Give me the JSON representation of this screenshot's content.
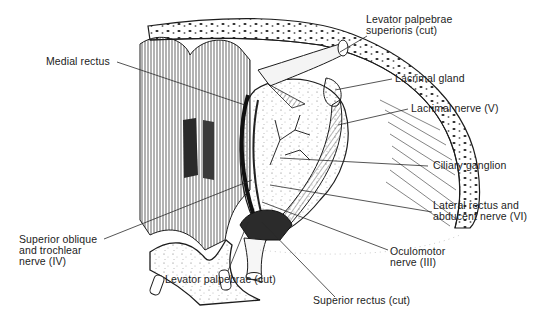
{
  "figure": {
    "colors": {
      "ink": "#1c1c1c",
      "background": "#ffffff",
      "stipple": "#6a6a6a"
    }
  },
  "labels": {
    "levator_superioris": "Levator palpebrae\nsuperioris (cut)",
    "medial_rectus": "Medial rectus",
    "lacrimal_gland": "Lacrimal gland",
    "lacrimal_nerve": "Lacrimal nerve (V)",
    "ciliary_ganglion": "Ciliary ganglion",
    "lateral_rectus": "Lateral rectus and\nabducent nerve (VI)",
    "oculomotor": "Oculomotor\nnerve (III)",
    "superior_oblique": "Superior oblique\nand trochlear\nnerve (IV)",
    "levator_cut": "Levator palpebrae (cut)",
    "superior_rectus": "Superior rectus (cut)"
  }
}
